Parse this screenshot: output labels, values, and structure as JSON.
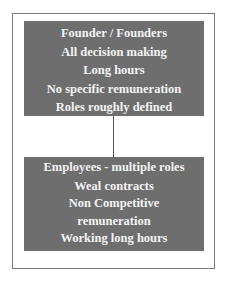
{
  "diagram": {
    "type": "hierarchy",
    "top_box": {
      "lines": [
        "Founder / Founders",
        "All decision making",
        "Long hours",
        "No specific remuneration",
        "Roles roughly defined"
      ]
    },
    "bottom_box": {
      "lines": [
        "Employees - multiple roles",
        "Weal contracts",
        "Non Competitive",
        "remuneration",
        "Working long hours"
      ]
    },
    "colors": {
      "box_fill": "#6e6e6e",
      "box_text": "#f4f4f4",
      "frame_border": "#7a7a7a",
      "connector": "#555555"
    }
  }
}
